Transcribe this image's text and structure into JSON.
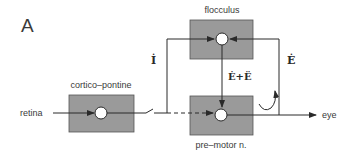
{
  "figure": {
    "panel_label": "A",
    "colors": {
      "box_fill": "#9a9a9a",
      "line": "#2a2a2a",
      "node_fill": "#ffffff",
      "text": "#3a3a3a"
    },
    "blocks": {
      "flocculus": {
        "label": "flocculus"
      },
      "cortico_pontine": {
        "label": "cortico–pontine"
      },
      "premotor": {
        "label": "pre–motor n."
      }
    },
    "signals": {
      "input": "retina",
      "output": "eye",
      "left_feedback": "İ",
      "right_feedback": "Ė",
      "descending": "Ė+Ë"
    }
  }
}
